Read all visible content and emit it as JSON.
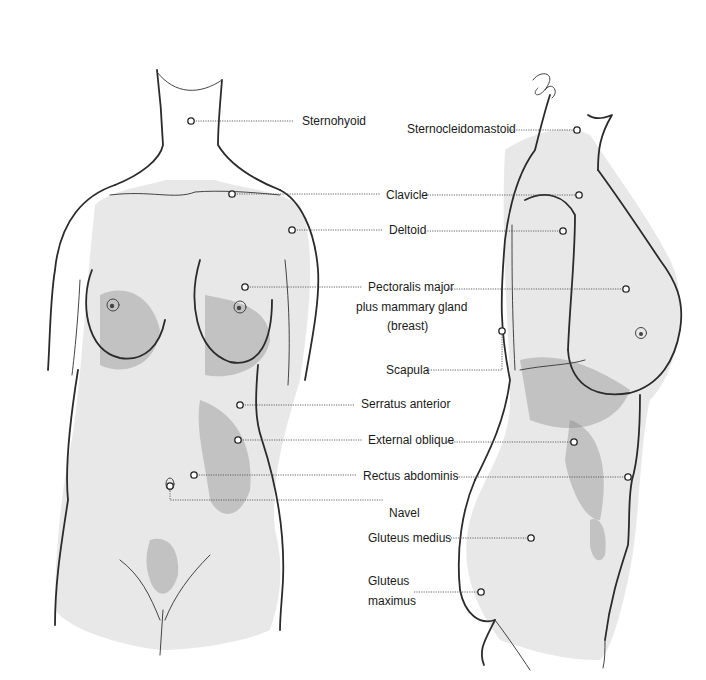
{
  "diagram": {
    "colors": {
      "background": "#ffffff",
      "ink": "#1a1a1a",
      "leader": "#555555"
    },
    "figures": [
      {
        "id": "front-view",
        "label": "Front view"
      },
      {
        "id": "side-view",
        "label": "Side view"
      }
    ],
    "labels": [
      {
        "id": "sternohyoid",
        "text": "Sternohyoid",
        "x": 302,
        "y": 125
      },
      {
        "id": "sternocleidomastoid",
        "text": "Sternocleidomastoid",
        "x": 407,
        "y": 133
      },
      {
        "id": "clavicle",
        "text": "Clavicle",
        "x": 386,
        "y": 199
      },
      {
        "id": "deltoid",
        "text": "Deltoid",
        "x": 389,
        "y": 234
      },
      {
        "id": "pectoralis-1",
        "text": "Pectoralis major",
        "x": 368,
        "y": 291
      },
      {
        "id": "pectoralis-2",
        "text": "plus mammary gland",
        "x": 356,
        "y": 311
      },
      {
        "id": "pectoralis-3",
        "text": "(breast)",
        "x": 387,
        "y": 330
      },
      {
        "id": "scapula",
        "text": "Scapula",
        "x": 386,
        "y": 374
      },
      {
        "id": "serratus",
        "text": "Serratus anterior",
        "x": 361,
        "y": 408
      },
      {
        "id": "external-oblique",
        "text": "External oblique",
        "x": 368,
        "y": 444
      },
      {
        "id": "rectus",
        "text": "Rectus abdominis",
        "x": 363,
        "y": 480
      },
      {
        "id": "navel",
        "text": "Navel",
        "x": 389,
        "y": 517
      },
      {
        "id": "gluteus-medius",
        "text": "Gluteus medius",
        "x": 368,
        "y": 542
      },
      {
        "id": "gluteus-max-1",
        "text": "Gluteus",
        "x": 368,
        "y": 585
      },
      {
        "id": "gluteus-max-2",
        "text": "maximus",
        "x": 368,
        "y": 605
      }
    ],
    "leaders": [
      {
        "id": "sternohyoid-line",
        "points": "191,121 294,121",
        "marker": [
          191,
          121
        ]
      },
      {
        "id": "clavicle-front-line",
        "points": "232,194 380,194",
        "marker": [
          232,
          194
        ]
      },
      {
        "id": "deltoid-front-line",
        "points": "292,230 382,230",
        "marker": [
          292,
          230
        ]
      },
      {
        "id": "pectoralis-front-line",
        "points": "245,287 362,287",
        "marker": [
          245,
          287
        ]
      },
      {
        "id": "serratus-line",
        "points": "240,405 355,405",
        "marker": [
          240,
          405
        ]
      },
      {
        "id": "oblique-front-line",
        "points": "238,440 362,440",
        "marker": [
          238,
          440
        ]
      },
      {
        "id": "rectus-front-line",
        "points": "194,475 357,475",
        "marker": [
          194,
          475
        ]
      },
      {
        "id": "navel-line",
        "points": "170,486 170,500 383,500",
        "marker": [
          170,
          486
        ]
      },
      {
        "id": "sternocleido-line",
        "points": "509,130 577,130",
        "marker": [
          577,
          130
        ]
      },
      {
        "id": "clavicle-side-line",
        "points": "425,195 579,195",
        "marker": [
          579,
          195
        ]
      },
      {
        "id": "deltoid-side-line",
        "points": "425,231 563,231",
        "marker": [
          563,
          231
        ]
      },
      {
        "id": "pectoralis-side-line",
        "points": "447,289 626,289",
        "marker": [
          626,
          289
        ]
      },
      {
        "id": "scapula-line",
        "points": "426,370 502,370 502,331",
        "marker": [
          502,
          331
        ]
      },
      {
        "id": "oblique-side-line",
        "points": "447,442 574,442",
        "marker": [
          574,
          442
        ]
      },
      {
        "id": "rectus-side-line",
        "points": "454,477 628,477",
        "marker": [
          628,
          477
        ]
      },
      {
        "id": "gluteus-medius-line",
        "points": "446,538 531,538",
        "marker": [
          531,
          538
        ]
      },
      {
        "id": "gluteus-max-line",
        "points": "414,592 481,592",
        "marker": [
          481,
          592
        ]
      }
    ]
  }
}
